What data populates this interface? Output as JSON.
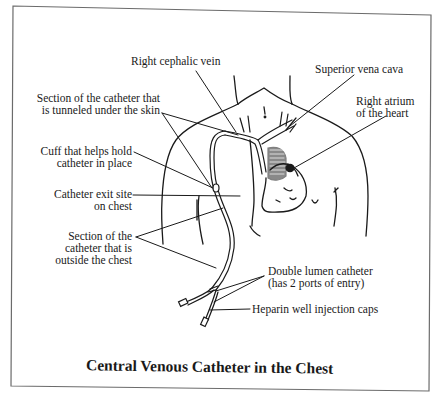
{
  "diagram": {
    "title": "Central Venous Catheter in the Chest",
    "labels": {
      "right_cephalic_vein": "Right cephalic vein",
      "superior_vena_cava": "Superior vena cava",
      "tunneled_section": [
        "Section of the catheter that",
        "is tunneled under the skin"
      ],
      "right_atrium": [
        "Right atrium",
        "of the heart"
      ],
      "cuff": [
        "Cuff that helps hold",
        "catheter in place"
      ],
      "exit_site": [
        "Catheter exit site",
        "on chest"
      ],
      "outside_section": [
        "Section of the",
        "catheter that is",
        "outside the chest"
      ],
      "double_lumen": [
        "Double lumen catheter",
        "(has 2 ports of entry)"
      ],
      "heparin_caps": "Heparin well injection caps"
    },
    "colors": {
      "ink": "#1a1a1a",
      "border": "#6b6b6b",
      "background": "#ffffff"
    }
  }
}
